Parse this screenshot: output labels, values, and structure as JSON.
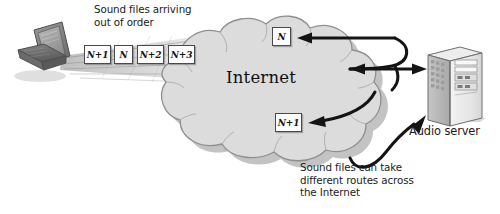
{
  "diagram": {
    "background_color": "#ffffff",
    "cloud_fill": "#dcdcdc",
    "cloud_stroke": "#8f8f8f",
    "shadow_color": "#b5b5b5",
    "ink_color": "#1a1a1a"
  },
  "captions": {
    "top": "Sound files arriving\nout of order",
    "bottom": "Sound files can take\ndifferent routes across\nthe Internet"
  },
  "cloud": {
    "label": "Internet"
  },
  "nodes": {
    "client": {
      "label": "",
      "icon": "laptop-icon"
    },
    "server": {
      "label": "Audio server",
      "icon": "tower-server-icon"
    }
  },
  "packets": {
    "stream": [
      {
        "id": "p1",
        "label": "N+1",
        "x": 84,
        "y": 45,
        "w": 27
      },
      {
        "id": "p2",
        "label": "N",
        "x": 114,
        "y": 45,
        "w": 19
      },
      {
        "id": "p3",
        "label": "N+2",
        "x": 137,
        "y": 45,
        "w": 27
      },
      {
        "id": "p4",
        "label": "N+3",
        "x": 168,
        "y": 45,
        "w": 27
      }
    ],
    "in_cloud": [
      {
        "id": "c1",
        "label": "N",
        "x": 272,
        "y": 27,
        "w": 19
      },
      {
        "id": "c2",
        "label": "N+1",
        "x": 275,
        "y": 113,
        "w": 27
      }
    ]
  },
  "arrows": [
    {
      "id": "arrow-top-into-cloud",
      "direction": "left",
      "description": "from right edge into cloud toward packet N"
    },
    {
      "id": "arrow-middle-to-server",
      "direction": "right",
      "description": "from cloud to audio server"
    },
    {
      "id": "arrow-lower-into-cloud",
      "direction": "left",
      "description": "from right into cloud toward packet N+1"
    },
    {
      "id": "arrow-bottom-to-server",
      "direction": "up",
      "description": "curved route from lower area up to audio server"
    }
  ]
}
